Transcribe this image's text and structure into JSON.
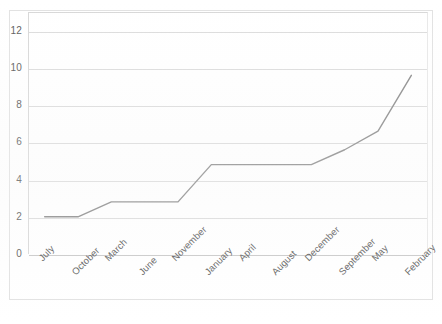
{
  "chart_data": {
    "type": "line",
    "title": "",
    "xlabel": "",
    "ylabel": "",
    "categories": [
      "July",
      "October",
      "March",
      "June",
      "November",
      "January",
      "April",
      "August",
      "December",
      "September",
      "May",
      "February"
    ],
    "values": [
      2.0,
      2.0,
      2.8,
      2.8,
      2.8,
      4.8,
      4.8,
      4.8,
      4.8,
      5.6,
      6.6,
      9.6
    ],
    "ylim": [
      0,
      13
    ],
    "yticks": [
      0,
      2,
      4,
      6,
      8,
      10,
      12
    ],
    "ytick_labels": [
      "0",
      "2",
      "4",
      "6",
      "8",
      "10",
      "12"
    ],
    "grid": true,
    "legend": "none",
    "series_color": "#8a8a8a",
    "grid_color": "#dcdcdc",
    "tick_label_color": "#5d5d5d",
    "background_color": "#ffffff",
    "x_label_rotation": -45
  }
}
